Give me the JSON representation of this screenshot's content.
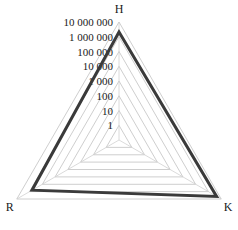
{
  "chart_data": {
    "type": "radar",
    "title": "",
    "scale": "log",
    "axes": [
      "H",
      "K",
      "R"
    ],
    "tick_labels": [
      "1",
      "10",
      "100",
      "1 000",
      "10 000",
      "100 000",
      "1 000 000",
      "10 000 000"
    ],
    "rlim": [
      1,
      10000000
    ],
    "grid": true,
    "legend": null,
    "series": [
      {
        "name": "series-1",
        "values": [
          2100000,
          4400000,
          650000
        ],
        "color": "#3a3a3a"
      }
    ]
  },
  "style": {
    "grid_color": "#c8c8c8",
    "series_color": "#3a3a3a"
  }
}
